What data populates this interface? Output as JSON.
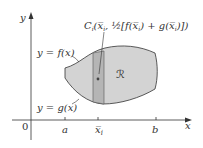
{
  "diagram": {
    "axes": {
      "x_label": "x",
      "y_label": "y",
      "origin_label": "0"
    },
    "ticks": [
      {
        "label": "a",
        "x": 65
      },
      {
        "label": "x̅",
        "sub": "i",
        "x": 98
      },
      {
        "label": "b",
        "x": 156
      }
    ],
    "curves": {
      "top_label": "y = f(x)",
      "bottom_label": "y = g(x)"
    },
    "region_label": "ℛ",
    "centroid_label": {
      "prefix": "C",
      "sub": "i",
      "body": "(x̅",
      "body_sub": "i",
      "rest": ", ½[f(x̅",
      "rest_sub": "i",
      "rest2": ") + g(x̅",
      "rest2_sub": "i",
      "rest3": ")])"
    },
    "colors": {
      "region_fill": "#d2d2d2",
      "strip_fill": "#b4b4b4",
      "stroke": "#333333",
      "background": "#ffffff"
    }
  }
}
